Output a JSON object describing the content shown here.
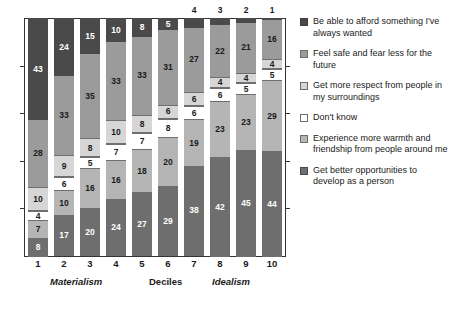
{
  "chart_data": {
    "type": "bar",
    "stacked": true,
    "title": "",
    "subtitle": "",
    "xlabel": "Deciles",
    "ylabel": "",
    "ylim": [
      0,
      100
    ],
    "grid": false,
    "legend_position": "right",
    "categories": [
      "1",
      "2",
      "3",
      "4",
      "5",
      "6",
      "7",
      "8",
      "9",
      "10"
    ],
    "axis_group_labels": [
      {
        "text": "Materialism",
        "align": "left"
      },
      {
        "text": "Deciles",
        "align": "center"
      },
      {
        "text": "Idealism",
        "align": "right"
      }
    ],
    "series": [
      {
        "name": "Be able to afford something I've always wanted",
        "color": "#4a4a4a",
        "values": [
          43,
          24,
          15,
          10,
          8,
          5,
          4,
          3,
          2,
          1
        ]
      },
      {
        "name": "Feel safe and fear less for the future",
        "color": "#9b9b9b",
        "values": [
          28,
          33,
          35,
          33,
          33,
          31,
          27,
          22,
          21,
          16
        ]
      },
      {
        "name": "Get more respect from people in my surroundings",
        "color": "#d6d6d6",
        "values": [
          10,
          9,
          8,
          10,
          8,
          6,
          6,
          4,
          4,
          4
        ]
      },
      {
        "name": "Don't know",
        "color": "#ffffff",
        "values": [
          4,
          6,
          5,
          7,
          7,
          8,
          6,
          6,
          5,
          5
        ]
      },
      {
        "name": "Experience more warmth and friendship from people around me",
        "color": "#b5b5b5",
        "values": [
          7,
          10,
          16,
          16,
          18,
          20,
          19,
          23,
          23,
          29
        ]
      },
      {
        "name": "Get better opportunities to develop as a person",
        "color": "#6e6e6e",
        "values": [
          8,
          17,
          20,
          24,
          27,
          29,
          38,
          42,
          45,
          44
        ]
      }
    ]
  },
  "legend": {
    "items": [
      {
        "label": "Be able to afford something I've always wanted",
        "swatch": "sw0"
      },
      {
        "label": "Feel safe and fear less for the future",
        "swatch": "sw1"
      },
      {
        "label": "Get more respect from people in my surroundings",
        "swatch": "sw2"
      },
      {
        "label": "Don't know",
        "swatch": "sw3"
      },
      {
        "label": "Experience more warmth and friendship from people around me",
        "swatch": "sw4"
      },
      {
        "label": "Get better opportunities to develop as a person",
        "swatch": "sw5"
      }
    ]
  },
  "axis": {
    "x_ticks": [
      "1",
      "2",
      "3",
      "4",
      "5",
      "6",
      "7",
      "8",
      "9",
      "10"
    ],
    "group_left": "Materialism",
    "group_mid": "Deciles",
    "group_right": "Idealism"
  }
}
